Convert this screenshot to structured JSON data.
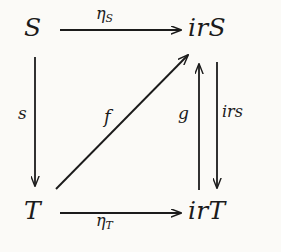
{
  "diagram": {
    "type": "commutative-diagram",
    "background_color": "#fbfaf7",
    "ink_color": "#1b1b1b",
    "nodes": [
      {
        "id": "S",
        "label": "S",
        "position": "top-left"
      },
      {
        "id": "irS",
        "label": "irS",
        "position": "top-right"
      },
      {
        "id": "T",
        "label": "T",
        "position": "bottom-left"
      },
      {
        "id": "irT",
        "label": "irT",
        "position": "bottom-right"
      }
    ],
    "edges": [
      {
        "id": "eta-S",
        "from": "S",
        "to": "irS",
        "label_base": "η",
        "label_sub": "S",
        "direction": "right",
        "label_position": "above"
      },
      {
        "id": "eta-T",
        "from": "T",
        "to": "irT",
        "label_base": "η",
        "label_sub": "T",
        "direction": "right",
        "label_position": "below"
      },
      {
        "id": "s",
        "from": "S",
        "to": "T",
        "label_base": "s",
        "label_sub": "",
        "direction": "down",
        "label_position": "left"
      },
      {
        "id": "f",
        "from": "T",
        "to": "irS",
        "label_base": "f",
        "label_sub": "",
        "direction": "diagonal-up-right",
        "label_position": "left"
      },
      {
        "id": "g",
        "from": "irT",
        "to": "irS",
        "label_base": "g",
        "label_sub": "",
        "direction": "up",
        "label_position": "left"
      },
      {
        "id": "irs",
        "from": "irS",
        "to": "irT",
        "label_base": "irs",
        "label_sub": "",
        "direction": "down",
        "label_position": "right"
      }
    ]
  }
}
